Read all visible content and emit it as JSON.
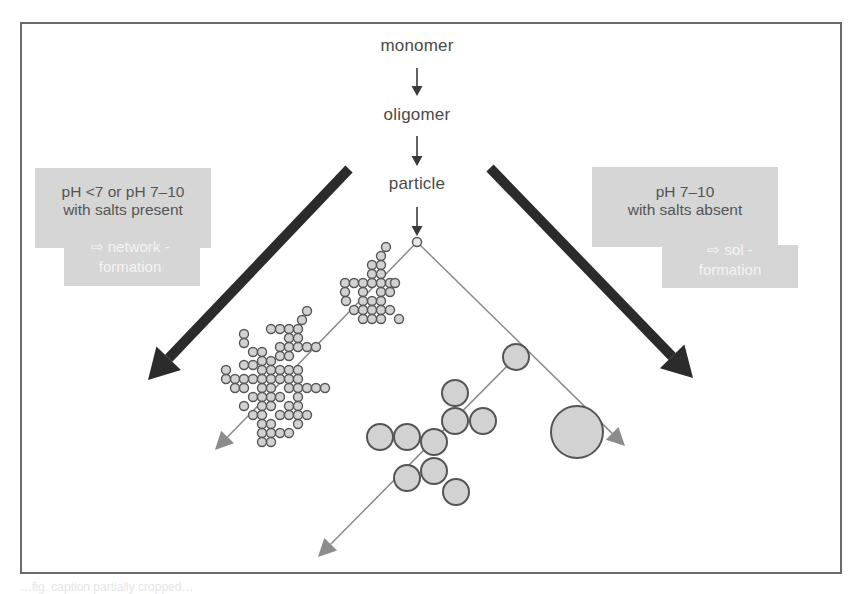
{
  "diagram": {
    "sequence": [
      {
        "label": "monomer",
        "x": 417,
        "y": 48
      },
      {
        "label": "oligomer",
        "x": 417,
        "y": 117
      },
      {
        "label": "particle",
        "x": 417,
        "y": 186
      }
    ],
    "left_condition": {
      "line1": "pH <7 or pH 7–10",
      "line2": "with salts present",
      "outcome_line1": "⇨ network -",
      "outcome_line2": "formation"
    },
    "right_condition": {
      "line1": "pH 7–10",
      "line2": "with salts absent",
      "outcome_line1": "⇨ sol -",
      "outcome_line2": "formation"
    },
    "colors": {
      "frame": "#6a6a6a",
      "text": "#4a4a4a",
      "big_arrow": "#2b2b2b",
      "thin_line": "#8a8a8a",
      "arrowhead": "#8c8c8c",
      "box_fill": "#d6d6d6",
      "particle_fill": "#d2d2d2",
      "particle_stroke": "#555555"
    },
    "small_arrows": [
      {
        "x": 417,
        "y1": 68,
        "y2": 96
      },
      {
        "x": 417,
        "y1": 136,
        "y2": 166
      },
      {
        "x": 417,
        "y1": 207,
        "y2": 236
      }
    ],
    "big_arrows": [
      {
        "name": "network-pathway-arrow",
        "x1": 349,
        "y1": 169,
        "x2": 148,
        "y2": 380
      },
      {
        "name": "sol-pathway-arrow",
        "x1": 490,
        "y1": 168,
        "x2": 693,
        "y2": 378
      }
    ],
    "branch_origin": {
      "x": 417,
      "y": 242,
      "r": 4.5
    },
    "thin_arrows": [
      {
        "name": "network-growth-arrow",
        "x1": 417,
        "y1": 242,
        "x2": 215,
        "y2": 450
      },
      {
        "name": "sol-growth-arrow",
        "x1": 417,
        "y1": 242,
        "x2": 625,
        "y2": 446
      },
      {
        "name": "sol-aggregate-arrow",
        "x1": 516,
        "y1": 357,
        "x2": 318,
        "y2": 557
      }
    ],
    "network_small_cluster": {
      "r": 4.5,
      "points": [
        [
          386,
          247
        ],
        [
          381,
          256
        ],
        [
          372,
          265
        ],
        [
          381,
          265
        ],
        [
          372,
          274
        ],
        [
          381,
          274
        ],
        [
          363,
          283
        ],
        [
          372,
          283
        ],
        [
          381,
          283
        ],
        [
          390,
          283
        ],
        [
          345,
          283
        ],
        [
          354,
          283
        ],
        [
          345,
          292
        ],
        [
          363,
          292
        ],
        [
          381,
          292
        ],
        [
          390,
          292
        ],
        [
          372,
          301
        ],
        [
          363,
          301
        ],
        [
          381,
          301
        ],
        [
          346,
          301
        ],
        [
          354,
          310
        ],
        [
          363,
          310
        ],
        [
          372,
          310
        ],
        [
          381,
          310
        ],
        [
          390,
          310
        ],
        [
          363,
          319
        ],
        [
          381,
          319
        ],
        [
          399,
          319
        ],
        [
          372,
          319
        ],
        [
          395,
          283
        ]
      ]
    },
    "network_large_cluster": {
      "r": 4.5,
      "points": [
        [
          307,
          311
        ],
        [
          302,
          320
        ],
        [
          298,
          329
        ],
        [
          289,
          329
        ],
        [
          280,
          329
        ],
        [
          271,
          329
        ],
        [
          289,
          338
        ],
        [
          298,
          338
        ],
        [
          280,
          347
        ],
        [
          289,
          347
        ],
        [
          298,
          347
        ],
        [
          307,
          347
        ],
        [
          316,
          347
        ],
        [
          244,
          334
        ],
        [
          244,
          343
        ],
        [
          253,
          352
        ],
        [
          262,
          352
        ],
        [
          280,
          356
        ],
        [
          289,
          356
        ],
        [
          262,
          361
        ],
        [
          271,
          361
        ],
        [
          244,
          365
        ],
        [
          253,
          365
        ],
        [
          262,
          370
        ],
        [
          271,
          370
        ],
        [
          280,
          370
        ],
        [
          289,
          370
        ],
        [
          298,
          370
        ],
        [
          226,
          370
        ],
        [
          235,
          379
        ],
        [
          244,
          379
        ],
        [
          226,
          379
        ],
        [
          253,
          379
        ],
        [
          262,
          379
        ],
        [
          271,
          379
        ],
        [
          280,
          379
        ],
        [
          289,
          379
        ],
        [
          298,
          379
        ],
        [
          262,
          388
        ],
        [
          271,
          388
        ],
        [
          289,
          388
        ],
        [
          298,
          388
        ],
        [
          307,
          388
        ],
        [
          316,
          388
        ],
        [
          325,
          388
        ],
        [
          235,
          388
        ],
        [
          244,
          388
        ],
        [
          271,
          397
        ],
        [
          280,
          397
        ],
        [
          298,
          397
        ],
        [
          253,
          397
        ],
        [
          262,
          397
        ],
        [
          244,
          406
        ],
        [
          262,
          406
        ],
        [
          271,
          406
        ],
        [
          289,
          406
        ],
        [
          298,
          406
        ],
        [
          253,
          415
        ],
        [
          262,
          415
        ],
        [
          280,
          415
        ],
        [
          289,
          415
        ],
        [
          298,
          415
        ],
        [
          307,
          415
        ],
        [
          262,
          424
        ],
        [
          271,
          424
        ],
        [
          298,
          424
        ],
        [
          262,
          433
        ],
        [
          271,
          433
        ],
        [
          280,
          433
        ],
        [
          289,
          433
        ],
        [
          262,
          442
        ],
        [
          271,
          442
        ]
      ]
    },
    "sol_cluster": {
      "r": 13,
      "points": [
        [
          516,
          357
        ],
        [
          455,
          393
        ],
        [
          455,
          421
        ],
        [
          483,
          421
        ],
        [
          380,
          437
        ],
        [
          407,
          437
        ],
        [
          434,
          442
        ],
        [
          434,
          471
        ],
        [
          407,
          478
        ],
        [
          456,
          492
        ]
      ]
    },
    "sol_large_particle": {
      "x": 577,
      "y": 432,
      "r": 26
    },
    "caption": "…fig. caption partially cropped…"
  }
}
